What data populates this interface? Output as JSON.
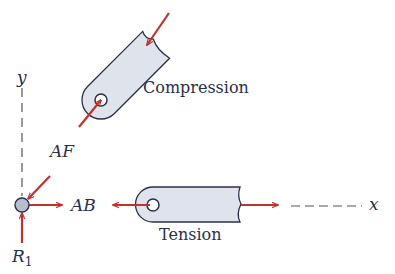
{
  "labels": {
    "y_axis": "y",
    "x_axis": "x",
    "af": "AF",
    "ab": "AB",
    "r1_main": "R",
    "r1_sub": "1",
    "compression": "Compression",
    "tension": "Tension"
  },
  "colors": {
    "arrow": "#c0312f",
    "member_fill": "#dfe4ec",
    "member_stroke": "#2a2f4a",
    "joint_fill": "#b8bfcc",
    "text": "#2a2f4a",
    "axis": "#555555"
  }
}
